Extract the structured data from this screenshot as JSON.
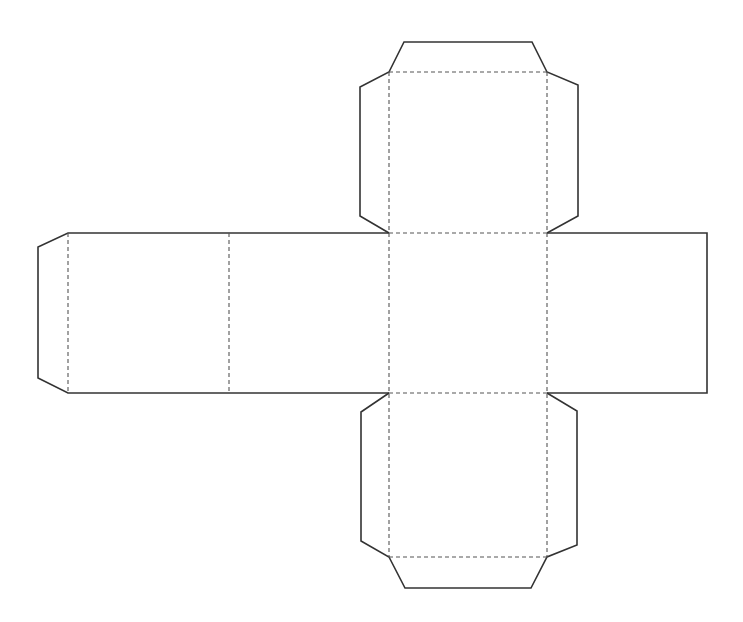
{
  "diagram": {
    "title": "",
    "type": "cube-net",
    "colors": {
      "background": "#ffffff",
      "cut_line": "#333333",
      "fold_line": "#555555"
    },
    "legend": [],
    "faces": [
      {
        "id": "top-face",
        "x": 389,
        "y": 72,
        "w": 158,
        "h": 161
      },
      {
        "id": "left-face",
        "x": 68,
        "y": 233,
        "w": 161,
        "h": 160
      },
      {
        "id": "middle-left-face",
        "x": 229,
        "y": 233,
        "w": 160,
        "h": 160
      },
      {
        "id": "center-face",
        "x": 389,
        "y": 233,
        "w": 158,
        "h": 160
      },
      {
        "id": "right-face",
        "x": 547,
        "y": 233,
        "w": 160,
        "h": 160
      },
      {
        "id": "bottom-face",
        "x": 389,
        "y": 393,
        "w": 158,
        "h": 164
      }
    ],
    "labels": []
  }
}
